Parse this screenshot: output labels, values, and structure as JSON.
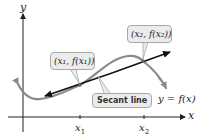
{
  "figure": {
    "type": "secant-line-diagram",
    "axes": {
      "x_label": "x",
      "y_label": "y"
    },
    "ticks": [
      {
        "label": "x",
        "sub": "1"
      },
      {
        "label": "x",
        "sub": "2"
      }
    ],
    "callouts": {
      "point1": "(x₁, f(x₁))",
      "point2": "(x₂, f(x₂))",
      "secant": "Secant line"
    },
    "function_label": "y = f(x)",
    "colors": {
      "curve": "#8a8a8a",
      "secant": "#111111",
      "axes": "#222222",
      "callout_fill": "#ececec",
      "callout_border": "#a8a8a8"
    }
  }
}
